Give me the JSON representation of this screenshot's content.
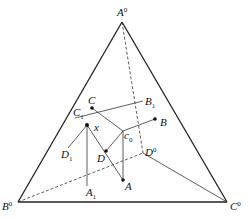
{
  "diagram": {
    "type": "quaternary-phase-diagram-tetrahedron-projection",
    "vertices": [
      {
        "id": "A0",
        "label": "A",
        "sup": "0",
        "x": 122,
        "y": 22,
        "lx": 117,
        "ly": 16
      },
      {
        "id": "B0",
        "label": "B",
        "sup": "0",
        "x": 18,
        "y": 202,
        "lx": 2,
        "ly": 210
      },
      {
        "id": "C0",
        "label": "C",
        "sup": "0",
        "x": 227,
        "y": 202,
        "lx": 230,
        "ly": 210
      },
      {
        "id": "D0",
        "label": "D",
        "sup": "0",
        "x": 143,
        "y": 153,
        "lx": 145,
        "ly": 152
      }
    ],
    "points": [
      {
        "id": "A",
        "label": "A",
        "sub": "",
        "x": 123,
        "y": 180,
        "lx": 125,
        "ly": 190
      },
      {
        "id": "B",
        "label": "B",
        "sub": "",
        "x": 155,
        "y": 119,
        "lx": 160,
        "ly": 126
      },
      {
        "id": "C",
        "label": "C",
        "sub": "",
        "x": 92,
        "y": 108,
        "lx": 88,
        "ly": 104
      },
      {
        "id": "D",
        "label": "D",
        "sub": "",
        "x": 106,
        "y": 151,
        "lx": 97,
        "ly": 162
      },
      {
        "id": "x",
        "label": "x",
        "sub": "",
        "x": 87,
        "y": 125,
        "lx": 94,
        "ly": 131
      },
      {
        "id": "c0",
        "label": "c",
        "sub": "0",
        "x": 123,
        "y": 131,
        "lx": 127,
        "ly": 141
      },
      {
        "id": "A1",
        "label": "A",
        "sub": "1",
        "x": 87,
        "y": 186,
        "lx": 86,
        "ly": 197
      },
      {
        "id": "B1",
        "label": "B",
        "sub": "1",
        "x": 143,
        "y": 101,
        "lx": 145,
        "ly": 107
      },
      {
        "id": "C1",
        "label": "C",
        "sub": "1",
        "x": 75,
        "y": 118,
        "lx": 73,
        "ly": 116
      },
      {
        "id": "D1",
        "label": "D",
        "sub": "1",
        "x": 68,
        "y": 148,
        "lx": 62,
        "ly": 160
      }
    ],
    "dotted_points": [
      "A",
      "B",
      "C",
      "D",
      "x"
    ]
  }
}
